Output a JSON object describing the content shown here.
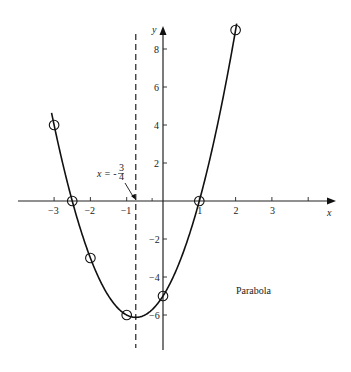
{
  "chart_data": {
    "type": "line",
    "title": "",
    "annotation": "Parabola",
    "function": "y = 2x^2 + 3x - 5",
    "xlabel": "x",
    "ylabel": "y",
    "xlim": [
      -3.4,
      4.5
    ],
    "ylim": [
      -7.8,
      9.6
    ],
    "x_ticks": [
      -3,
      -2,
      -1,
      1,
      2,
      3,
      4
    ],
    "x_tick_labels": [
      "-3",
      "-2",
      "-1",
      "1",
      "2",
      "3",
      ""
    ],
    "y_ticks": [
      8,
      6,
      4,
      2,
      -2,
      -4,
      -6
    ],
    "y_tick_labels": [
      "8",
      "6",
      "4",
      "2",
      "-2",
      "-4",
      "-6"
    ],
    "grid": false,
    "points": [
      {
        "x": -3,
        "y": 4
      },
      {
        "x": -2.5,
        "y": 0
      },
      {
        "x": -2,
        "y": -3
      },
      {
        "x": -1,
        "y": -6
      },
      {
        "x": 0,
        "y": -5
      },
      {
        "x": 1,
        "y": 0
      },
      {
        "x": 2,
        "y": 9
      }
    ],
    "axis_of_symmetry": {
      "x": -0.75,
      "label": "x = -3/4",
      "label_prefix": "x = -",
      "num": "3",
      "den": "4"
    }
  },
  "labels": {
    "x_axis": "x",
    "y_axis": "y",
    "caption": "Parabola",
    "sym_prefix": "x = -",
    "sym_num": "3",
    "sym_den": "4"
  }
}
